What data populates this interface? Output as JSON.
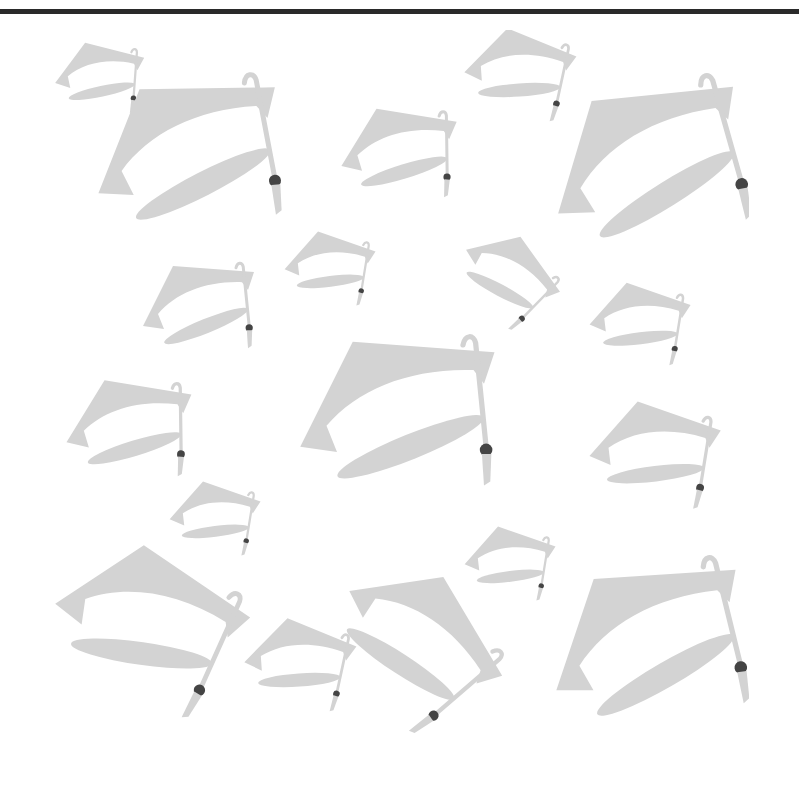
{
  "image": {
    "description": "Seamless pattern of flying graduation caps (mortarboards) with tassels",
    "caption": "Graduation caps pattern"
  },
  "colors": {
    "background": "#ffffff",
    "cap_fill": "#d3d3d3",
    "tassel_knot": "#444444",
    "top_rule": "#2a2a2a"
  },
  "pattern_bounds": {
    "x": 52,
    "y": 30,
    "width": 697,
    "height": 712
  },
  "caps": [
    {
      "id": 1,
      "x": 100,
      "y": 75,
      "scale": 0.45,
      "rotate": 10
    },
    {
      "id": 2,
      "x": 190,
      "y": 150,
      "scale": 1.0,
      "rotate": -5
    },
    {
      "id": 3,
      "x": 400,
      "y": 150,
      "scale": 0.6,
      "rotate": 5
    },
    {
      "id": 4,
      "x": 520,
      "y": 70,
      "scale": 0.55,
      "rotate": 18
    },
    {
      "id": 5,
      "x": 650,
      "y": 160,
      "scale": 1.05,
      "rotate": -10
    },
    {
      "id": 6,
      "x": 200,
      "y": 305,
      "scale": 0.6,
      "rotate": 0
    },
    {
      "id": 7,
      "x": 330,
      "y": 265,
      "scale": 0.45,
      "rotate": 15
    },
    {
      "id": 8,
      "x": 510,
      "y": 275,
      "scale": 0.5,
      "rotate": 50
    },
    {
      "id": 9,
      "x": 640,
      "y": 320,
      "scale": 0.5,
      "rotate": 15
    },
    {
      "id": 10,
      "x": 400,
      "y": 410,
      "scale": 1.05,
      "rotate": 0
    },
    {
      "id": 11,
      "x": 130,
      "y": 425,
      "scale": 0.65,
      "rotate": 5
    },
    {
      "id": 12,
      "x": 655,
      "y": 450,
      "scale": 0.65,
      "rotate": 15
    },
    {
      "id": 13,
      "x": 215,
      "y": 515,
      "scale": 0.45,
      "rotate": 15
    },
    {
      "id": 14,
      "x": 510,
      "y": 560,
      "scale": 0.45,
      "rotate": 15
    },
    {
      "id": 15,
      "x": 150,
      "y": 620,
      "scale": 0.95,
      "rotate": 30
    },
    {
      "id": 16,
      "x": 300,
      "y": 660,
      "scale": 0.55,
      "rotate": 18
    },
    {
      "id": 17,
      "x": 420,
      "y": 640,
      "scale": 0.85,
      "rotate": 55
    },
    {
      "id": 18,
      "x": 650,
      "y": 640,
      "scale": 1.05,
      "rotate": -8
    }
  ]
}
